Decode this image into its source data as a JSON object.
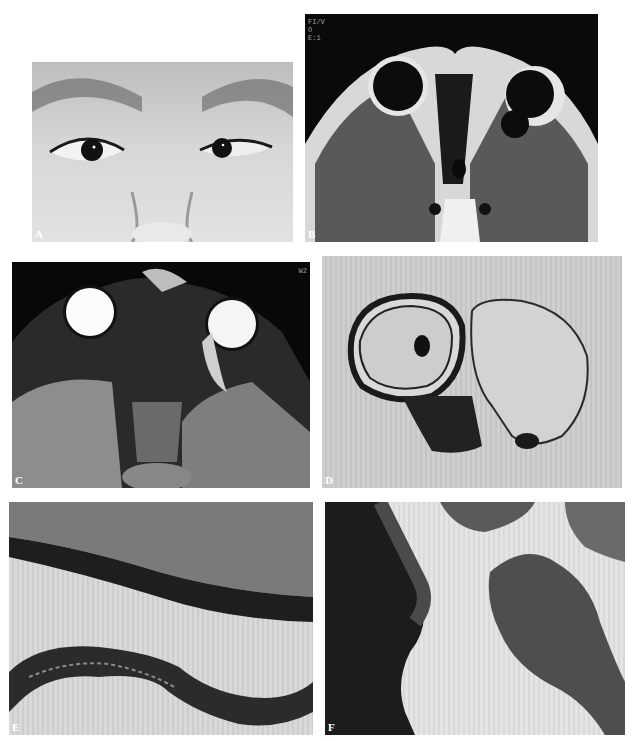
{
  "figure": {
    "panels": [
      {
        "id": "A",
        "label": "A",
        "content": "clinical photograph of patient's eyes"
      },
      {
        "id": "B",
        "label": "B",
        "content": "axial T1-weighted MRI of orbits",
        "overlay_text": "FI/V\nO\nE:1"
      },
      {
        "id": "C",
        "label": "C",
        "content": "axial T2-weighted MRI of orbits",
        "overlay_text": "W2"
      },
      {
        "id": "D",
        "label": "D",
        "content": "gross specimen of enucleated eye with cyst"
      },
      {
        "id": "E",
        "label": "E",
        "content": "histology section, cyst wall"
      },
      {
        "id": "F",
        "label": "F",
        "content": "histology section, tissue"
      }
    ]
  }
}
